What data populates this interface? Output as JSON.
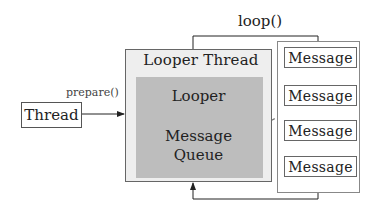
{
  "diagram": {
    "type": "android-looper-architecture",
    "nodes": {
      "thread": {
        "label": "Thread"
      },
      "looper_thread": {
        "label": "Looper Thread"
      },
      "looper": {
        "label": "Looper"
      },
      "message_queue": {
        "label_line1": "Message",
        "label_line2": "Queue"
      },
      "messages": [
        {
          "label": "Message"
        },
        {
          "label": "Message"
        },
        {
          "label": "Message"
        },
        {
          "label": "Message"
        }
      ]
    },
    "edges": {
      "prepare": {
        "label": "prepare()",
        "from": "thread",
        "to": "looper_thread"
      },
      "loop": {
        "label": "loop()",
        "from": "looper_thread",
        "to": "messages"
      },
      "queue_link": {
        "style": "dashed",
        "from": "message_queue",
        "to": "messages"
      }
    },
    "colors": {
      "outer_box_fill": "#eeeeee",
      "inner_box_fill": "#bdbdbd",
      "line": "#222222",
      "dashed_line": "#777777"
    }
  }
}
